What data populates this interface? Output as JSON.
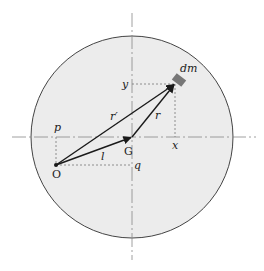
{
  "diagram": {
    "colors": {
      "disc_fill": "#ececec",
      "outline": "#444444",
      "axis": "#888888",
      "vector": "#1a1a1a",
      "dashed": "#777777",
      "mass_element": "#777777"
    },
    "labels": {
      "origin": "O",
      "center_of_mass": "G",
      "mass_element": "dm",
      "vector_r_prime": "r′",
      "vector_r": "r",
      "vector_l": "l",
      "coord_x": "x",
      "coord_y": "y",
      "coord_p": "p",
      "coord_q": "q"
    },
    "vectors": [
      {
        "name": "l",
        "from": "O",
        "to": "G"
      },
      {
        "name": "r′",
        "from": "O",
        "to": "dm"
      },
      {
        "name": "r",
        "from": "G",
        "to": "dm"
      }
    ]
  }
}
